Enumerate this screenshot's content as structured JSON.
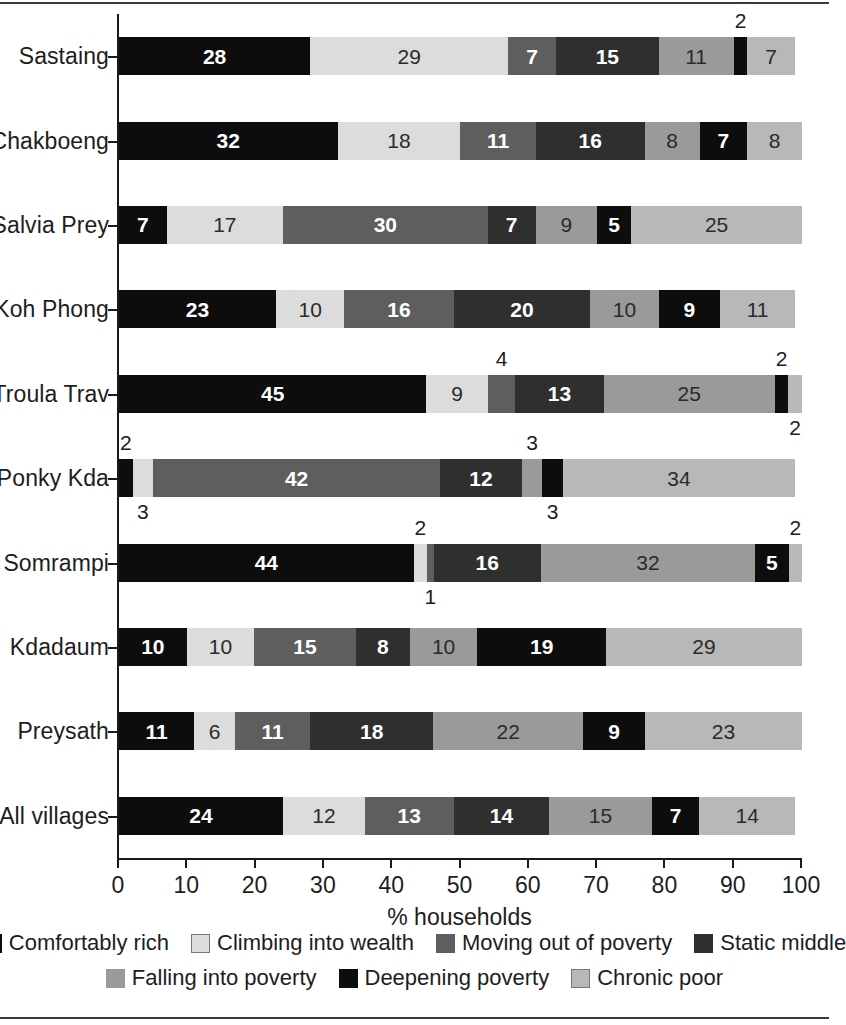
{
  "chart_data": {
    "type": "bar",
    "subtype": "horizontal-stacked-100",
    "title": "",
    "xlabel": "% households",
    "ylabel": "",
    "xlim": [
      0,
      100
    ],
    "xticks": [
      "0",
      "10",
      "20",
      "30",
      "40",
      "50",
      "60",
      "70",
      "80",
      "90",
      "100"
    ],
    "grid": false,
    "legend_position": "bottom",
    "categories": [
      "Sastaing",
      "Chakboeng",
      "Salvia Prey",
      "Koh Phong",
      "Troula Trav",
      "Ponky Kda",
      "Somrampi",
      "Kdadaum",
      "Preysath",
      "All villages"
    ],
    "series": [
      {
        "name": "Comfortably rich",
        "color": "#0d0d0d",
        "values": [
          28,
          32,
          7,
          23,
          45,
          2,
          44,
          10,
          11,
          24
        ]
      },
      {
        "name": "Climbing into wealth",
        "color": "#dcdcdc",
        "values": [
          29,
          18,
          17,
          10,
          9,
          3,
          2,
          10,
          6,
          12
        ]
      },
      {
        "name": "Moving out of poverty",
        "color": "#5e5e5e",
        "values": [
          7,
          11,
          30,
          16,
          4,
          42,
          1,
          15,
          11,
          13
        ]
      },
      {
        "name": "Static middle",
        "color": "#2f2f2f",
        "values": [
          15,
          16,
          7,
          20,
          13,
          12,
          16,
          8,
          18,
          14
        ]
      },
      {
        "name": "Falling into poverty",
        "color": "#9a9a9a",
        "values": [
          11,
          8,
          9,
          10,
          25,
          3,
          32,
          10,
          22,
          15
        ]
      },
      {
        "name": "Deepening poverty",
        "color": "#0d0d0d",
        "values": [
          2,
          7,
          5,
          9,
          2,
          3,
          5,
          19,
          9,
          7
        ]
      },
      {
        "name": "Chronic poor",
        "color": "#b8b8b8",
        "values": [
          7,
          8,
          25,
          11,
          2,
          34,
          2,
          29,
          23,
          14
        ]
      }
    ],
    "label_placement": {
      "Sastaing": [
        "in",
        "in",
        "in",
        "in",
        "in",
        "above",
        "in"
      ],
      "Chakboeng": [
        "in",
        "in",
        "in",
        "in",
        "in",
        "in",
        "in"
      ],
      "Salvia Prey": [
        "in",
        "in",
        "in",
        "in",
        "in",
        "in",
        "in"
      ],
      "Koh Phong": [
        "in",
        "in",
        "in",
        "in",
        "in",
        "in",
        "in"
      ],
      "Troula Trav": [
        "in",
        "in",
        "above",
        "in",
        "in",
        "above",
        "below"
      ],
      "Ponky Kda": [
        "above",
        "below",
        "in",
        "in",
        "above",
        "below",
        "in"
      ],
      "Somrampi": [
        "in",
        "above",
        "below",
        "in",
        "in",
        "in",
        "above"
      ],
      "Kdadaum": [
        "in",
        "in",
        "in",
        "in",
        "in",
        "in",
        "in"
      ],
      "Preysath": [
        "in",
        "in",
        "in",
        "in",
        "in",
        "in",
        "in"
      ],
      "All villages": [
        "in",
        "in",
        "in",
        "in",
        "in",
        "in",
        "in"
      ]
    }
  },
  "axis": {
    "x_title": "% households",
    "ticks": [
      "0",
      "10",
      "20",
      "30",
      "40",
      "50",
      "60",
      "70",
      "80",
      "90",
      "100"
    ]
  },
  "legend": {
    "row1": [
      {
        "label": "Comfortably rich",
        "color": "#0d0d0d"
      },
      {
        "label": "Climbing into wealth",
        "color": "#dcdcdc"
      },
      {
        "label": "Moving out of poverty",
        "color": "#5e5e5e"
      },
      {
        "label": "Static middle",
        "color": "#2f2f2f"
      }
    ],
    "row2": [
      {
        "label": "Falling into poverty",
        "color": "#9a9a9a"
      },
      {
        "label": "Deepening poverty",
        "color": "#0d0d0d"
      },
      {
        "label": "Chronic poor",
        "color": "#b8b8b8"
      }
    ]
  }
}
